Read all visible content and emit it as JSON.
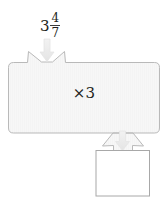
{
  "diagram": {
    "type": "function-machine",
    "input": {
      "label": "3 4/7",
      "whole": "3",
      "numerator": "4",
      "denominator": "7"
    },
    "operation": {
      "label": "×3",
      "symbol": "×",
      "factor": "3"
    },
    "output": {
      "label": "",
      "placeholder": ""
    },
    "arrows": {
      "input_arrow_name": "down-arrow-icon",
      "output_arrow_name": "down-arrow-icon"
    },
    "colors": {
      "body_fill": "#f7f7f7",
      "body_stroke": "#b9b9b9",
      "arrow_fill": "#ededed",
      "arrow_stroke": "#e2e2e2",
      "box_fill": "#ffffff",
      "box_stroke": "#a8a8a8",
      "text": "#231f20",
      "background": "#ffffff"
    }
  }
}
